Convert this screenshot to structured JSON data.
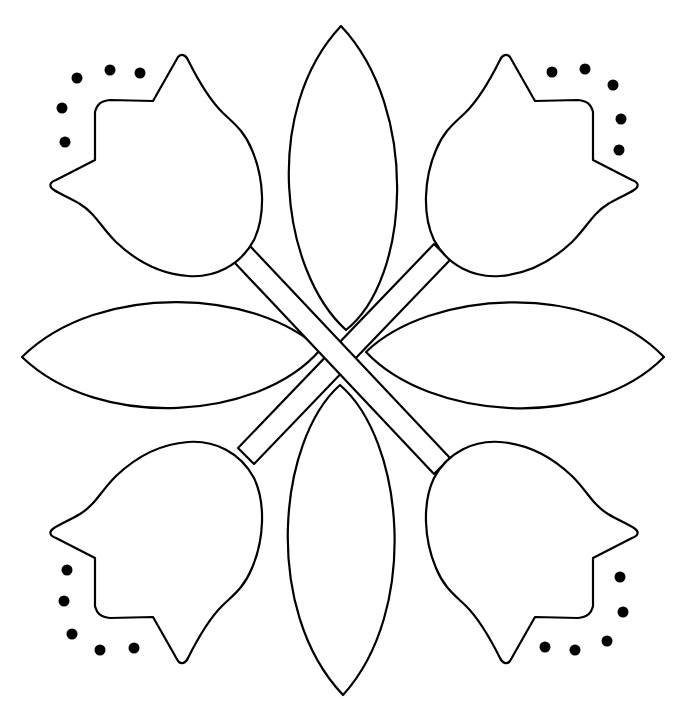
{
  "figure": {
    "style": "black line art on white",
    "colors": {
      "background": "#ffffff",
      "stroke": "#000000",
      "dots": "#000000"
    }
  },
  "elements": {
    "tulips": [
      {
        "position": "top-left"
      },
      {
        "position": "top-right"
      },
      {
        "position": "bottom-left"
      },
      {
        "position": "bottom-right"
      }
    ],
    "leaves": [
      {
        "position": "top"
      },
      {
        "position": "bottom"
      },
      {
        "position": "left"
      },
      {
        "position": "right"
      }
    ],
    "stems": [
      {
        "direction": "top-left to bottom-right",
        "layer": "front"
      },
      {
        "direction": "top-right to bottom-left",
        "layer": "back"
      }
    ],
    "dot_groups": [
      {
        "corner": "top-left",
        "count": 5
      },
      {
        "corner": "top-right",
        "count": 5
      },
      {
        "corner": "bottom-left",
        "count": 5
      },
      {
        "corner": "bottom-right",
        "count": 5
      }
    ]
  }
}
